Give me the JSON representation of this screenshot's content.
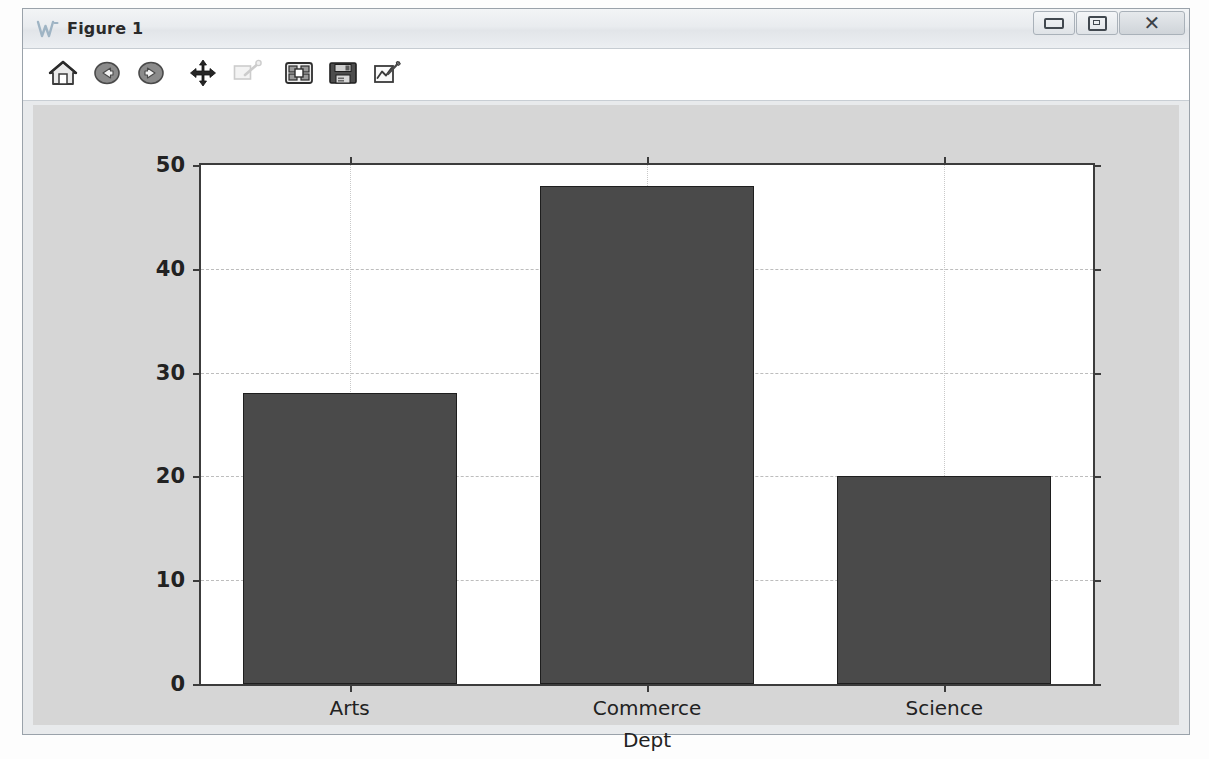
{
  "window": {
    "title": "Figure 1",
    "logo_icon": "matplotlib-w-icon",
    "minimize_label": "",
    "maximize_label": "",
    "close_label": "✕"
  },
  "toolbar": {
    "buttons": [
      {
        "name": "home-icon",
        "tooltip": "Reset original view",
        "enabled": true
      },
      {
        "name": "back-arrow-icon",
        "tooltip": "Back to previous view",
        "enabled": true
      },
      {
        "name": "forward-arrow-icon",
        "tooltip": "Forward to next view",
        "enabled": true
      },
      {
        "name": "pan-move-icon",
        "tooltip": "Pan axes with left mouse, zoom with right",
        "enabled": true
      },
      {
        "name": "zoom-rect-icon",
        "tooltip": "Zoom to rectangle",
        "enabled": false
      },
      {
        "name": "subplot-config-icon",
        "tooltip": "Configure subplots",
        "enabled": true
      },
      {
        "name": "save-floppy-icon",
        "tooltip": "Save the figure",
        "enabled": true
      },
      {
        "name": "edit-curve-icon",
        "tooltip": "Edit axis, curve and image parameters",
        "enabled": true
      }
    ]
  },
  "chart_data": {
    "type": "bar",
    "title": "",
    "categories": [
      "Arts",
      "Commerce",
      "Science"
    ],
    "values": [
      28,
      48,
      20
    ],
    "xlabel": "Dept",
    "ylabel": "",
    "ylim": [
      0,
      50
    ],
    "yticks": [
      0,
      10,
      20,
      30,
      40,
      50
    ],
    "ytick_labels": [
      "0",
      "10",
      "20",
      "30",
      "40",
      "50"
    ],
    "grid": true,
    "legend": "none",
    "bar_color": "#4a4a4a",
    "bar_edge_color": "#1e1e1e",
    "axes_bg": "#ffffff",
    "figure_bg": "#d6d6d6",
    "grid_color": "#bdbdbd",
    "bar_width_fraction": 0.72
  }
}
